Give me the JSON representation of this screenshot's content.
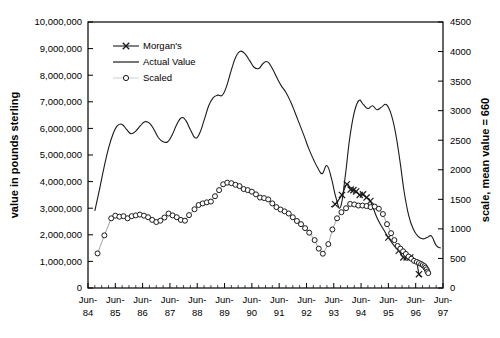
{
  "chart_data": {
    "type": "line",
    "title": "",
    "xlabel": "",
    "ylabel": "value in pounds sterling",
    "y2label": "scale, mean value = 660",
    "xlim": [
      "Jun-84",
      "Jun-97"
    ],
    "ylim": [
      0,
      10000000
    ],
    "y2lim": [
      0,
      4500
    ],
    "grid": false,
    "legend_position": "top-left-inside",
    "y_ticks": [
      "0",
      "1,000,000",
      "2,000,000",
      "3,000,000",
      "4,000,000",
      "5,000,000",
      "6,000,000",
      "7,000,000",
      "8,000,000",
      "9,000,000",
      "10,000,000"
    ],
    "y_tick_values": [
      0,
      1000000,
      2000000,
      3000000,
      4000000,
      5000000,
      6000000,
      7000000,
      8000000,
      9000000,
      10000000
    ],
    "y2_ticks": [
      "0",
      "500",
      "1000",
      "1500",
      "2000",
      "2500",
      "3000",
      "3500",
      "4000",
      "4500"
    ],
    "y2_tick_values": [
      0,
      500,
      1000,
      1500,
      2000,
      2500,
      3000,
      3500,
      4000,
      4500
    ],
    "x_ticks": [
      {
        "line1": "Jun-",
        "line2": "84",
        "value": 1984.5
      },
      {
        "line1": "Jun-",
        "line2": "85",
        "value": 1985.5
      },
      {
        "line1": "Jun-",
        "line2": "86",
        "value": 1986.5
      },
      {
        "line1": "Jun-",
        "line2": "87",
        "value": 1987.5
      },
      {
        "line1": "Jun-",
        "line2": "88",
        "value": 1988.5
      },
      {
        "line1": "Jun-",
        "line2": "89",
        "value": 1989.5
      },
      {
        "line1": "Jun-",
        "line2": "90",
        "value": 1990.5
      },
      {
        "line1": "Jun-",
        "line2": "91",
        "value": 1991.5
      },
      {
        "line1": "Jun-",
        "line2": "92",
        "value": 1992.5
      },
      {
        "line1": "Jun-",
        "line2": "93",
        "value": 1993.5
      },
      {
        "line1": "Jun-",
        "line2": "94",
        "value": 1994.5
      },
      {
        "line1": "Jun-",
        "line2": "95",
        "value": 1995.5
      },
      {
        "line1": "Jun-",
        "line2": "96",
        "value": 1996.5
      },
      {
        "line1": "Jun-",
        "line2": "97",
        "value": 1997.5
      }
    ],
    "legend": [
      {
        "name": "Morgan's",
        "marker": "x",
        "line": true
      },
      {
        "name": "Actual Value",
        "marker": "none",
        "line": true
      },
      {
        "name": "Scaled",
        "marker": "circle",
        "line": true
      }
    ],
    "series": [
      {
        "name": "Actual Value",
        "axis": "left",
        "marker": "none",
        "points": [
          [
            1984.75,
            2900000
          ],
          [
            1984.92,
            3700000
          ],
          [
            1985.08,
            4500000
          ],
          [
            1985.25,
            5250000
          ],
          [
            1985.42,
            5800000
          ],
          [
            1985.58,
            6100000
          ],
          [
            1985.75,
            6150000
          ],
          [
            1985.92,
            5950000
          ],
          [
            1986.08,
            5800000
          ],
          [
            1986.25,
            5900000
          ],
          [
            1986.42,
            6100000
          ],
          [
            1986.58,
            6250000
          ],
          [
            1986.75,
            6200000
          ],
          [
            1986.92,
            5950000
          ],
          [
            1987.08,
            5650000
          ],
          [
            1987.25,
            5500000
          ],
          [
            1987.42,
            5500000
          ],
          [
            1987.58,
            5750000
          ],
          [
            1987.75,
            6150000
          ],
          [
            1987.92,
            6400000
          ],
          [
            1988.08,
            6300000
          ],
          [
            1988.25,
            5950000
          ],
          [
            1988.42,
            5650000
          ],
          [
            1988.58,
            5800000
          ],
          [
            1988.75,
            6300000
          ],
          [
            1988.92,
            6850000
          ],
          [
            1989.08,
            7150000
          ],
          [
            1989.25,
            7250000
          ],
          [
            1989.42,
            7250000
          ],
          [
            1989.58,
            7600000
          ],
          [
            1989.75,
            8200000
          ],
          [
            1989.92,
            8700000
          ],
          [
            1990.08,
            8900000
          ],
          [
            1990.25,
            8800000
          ],
          [
            1990.42,
            8550000
          ],
          [
            1990.58,
            8300000
          ],
          [
            1990.75,
            8250000
          ],
          [
            1990.92,
            8450000
          ],
          [
            1991.08,
            8500000
          ],
          [
            1991.25,
            8250000
          ],
          [
            1991.42,
            7900000
          ],
          [
            1991.58,
            7600000
          ],
          [
            1991.75,
            7350000
          ],
          [
            1991.92,
            7000000
          ],
          [
            1992.08,
            6600000
          ],
          [
            1992.25,
            6150000
          ],
          [
            1992.42,
            5700000
          ],
          [
            1992.58,
            5250000
          ],
          [
            1992.75,
            4850000
          ],
          [
            1992.92,
            4500000
          ],
          [
            1993.08,
            4300000
          ],
          [
            1993.25,
            4600000
          ],
          [
            1993.42,
            4100000
          ],
          [
            1993.58,
            3400000
          ],
          [
            1993.75,
            3050000
          ],
          [
            1993.92,
            4200000
          ],
          [
            1994.08,
            5600000
          ],
          [
            1994.25,
            6600000
          ],
          [
            1994.42,
            7050000
          ],
          [
            1994.58,
            6900000
          ],
          [
            1994.75,
            6750000
          ],
          [
            1994.92,
            6850000
          ],
          [
            1995.08,
            6700000
          ],
          [
            1995.25,
            6800000
          ],
          [
            1995.42,
            6900000
          ],
          [
            1995.58,
            6600000
          ],
          [
            1995.75,
            5900000
          ],
          [
            1995.92,
            4800000
          ],
          [
            1996.08,
            3600000
          ],
          [
            1996.25,
            2700000
          ],
          [
            1996.42,
            2200000
          ],
          [
            1996.58,
            1950000
          ],
          [
            1996.75,
            1850000
          ],
          [
            1996.92,
            1900000
          ],
          [
            1997.08,
            1950000
          ],
          [
            1997.25,
            1600000
          ],
          [
            1997.42,
            1500000
          ]
        ]
      },
      {
        "name": "Morgan's",
        "axis": "left",
        "marker": "x",
        "marker_points": [
          [
            1993.55,
            3150000
          ],
          [
            1993.8,
            3500000
          ],
          [
            1993.98,
            3900000
          ],
          [
            1994.12,
            3700000
          ],
          [
            1994.22,
            3680000
          ],
          [
            1994.32,
            3630000
          ],
          [
            1994.45,
            3500000
          ],
          [
            1994.57,
            3520000
          ],
          [
            1994.7,
            3400000
          ],
          [
            1994.84,
            3270000
          ],
          [
            1995.5,
            1900000
          ],
          [
            1995.88,
            1400000
          ],
          [
            1996.05,
            1150000
          ],
          [
            1996.17,
            1150000
          ],
          [
            1996.3,
            1150000
          ],
          [
            1996.62,
            520000
          ]
        ],
        "points": [
          [
            1993.4,
            3050000
          ],
          [
            1993.55,
            3150000
          ],
          [
            1993.8,
            3500000
          ],
          [
            1993.98,
            3900000
          ],
          [
            1994.12,
            3700000
          ],
          [
            1994.22,
            3680000
          ],
          [
            1994.32,
            3630000
          ],
          [
            1994.45,
            3500000
          ],
          [
            1994.57,
            3520000
          ],
          [
            1994.7,
            3400000
          ],
          [
            1994.84,
            3270000
          ],
          [
            1995.1,
            2600000
          ],
          [
            1995.35,
            2150000
          ],
          [
            1995.5,
            1900000
          ],
          [
            1995.7,
            1600000
          ],
          [
            1995.88,
            1400000
          ],
          [
            1996.05,
            1150000
          ],
          [
            1996.17,
            1150000
          ],
          [
            1996.3,
            1150000
          ],
          [
            1996.45,
            1080000
          ],
          [
            1996.55,
            900000
          ],
          [
            1996.62,
            520000
          ],
          [
            1996.7,
            420000
          ]
        ]
      },
      {
        "name": "Scaled",
        "axis": "left",
        "marker": "circle",
        "points": [
          [
            1984.85,
            1300000
          ],
          [
            1985.1,
            1980000
          ],
          [
            1985.35,
            2620000
          ],
          [
            1985.5,
            2720000
          ],
          [
            1985.65,
            2680000
          ],
          [
            1985.8,
            2700000
          ],
          [
            1985.95,
            2620000
          ],
          [
            1986.1,
            2700000
          ],
          [
            1986.25,
            2730000
          ],
          [
            1986.4,
            2760000
          ],
          [
            1986.55,
            2720000
          ],
          [
            1986.7,
            2660000
          ],
          [
            1986.85,
            2560000
          ],
          [
            1987.0,
            2480000
          ],
          [
            1987.15,
            2530000
          ],
          [
            1987.3,
            2650000
          ],
          [
            1987.45,
            2800000
          ],
          [
            1987.6,
            2730000
          ],
          [
            1987.75,
            2660000
          ],
          [
            1987.9,
            2560000
          ],
          [
            1988.05,
            2530000
          ],
          [
            1988.2,
            2740000
          ],
          [
            1988.4,
            2960000
          ],
          [
            1988.55,
            3120000
          ],
          [
            1988.7,
            3180000
          ],
          [
            1988.85,
            3220000
          ],
          [
            1989.0,
            3250000
          ],
          [
            1989.15,
            3450000
          ],
          [
            1989.3,
            3680000
          ],
          [
            1989.45,
            3900000
          ],
          [
            1989.6,
            3960000
          ],
          [
            1989.75,
            3940000
          ],
          [
            1989.9,
            3880000
          ],
          [
            1990.05,
            3830000
          ],
          [
            1990.2,
            3720000
          ],
          [
            1990.35,
            3680000
          ],
          [
            1990.5,
            3620000
          ],
          [
            1990.65,
            3520000
          ],
          [
            1990.8,
            3400000
          ],
          [
            1990.95,
            3380000
          ],
          [
            1991.1,
            3330000
          ],
          [
            1991.25,
            3180000
          ],
          [
            1991.4,
            3040000
          ],
          [
            1991.55,
            2950000
          ],
          [
            1991.7,
            2880000
          ],
          [
            1991.85,
            2800000
          ],
          [
            1992.0,
            2660000
          ],
          [
            1992.15,
            2520000
          ],
          [
            1992.3,
            2400000
          ],
          [
            1992.45,
            2250000
          ],
          [
            1992.6,
            2080000
          ],
          [
            1992.8,
            1800000
          ],
          [
            1992.95,
            1480000
          ],
          [
            1993.1,
            1290000
          ],
          [
            1993.3,
            1650000
          ],
          [
            1993.45,
            2200000
          ],
          [
            1993.62,
            2620000
          ],
          [
            1993.78,
            2850000
          ],
          [
            1993.95,
            3000000
          ],
          [
            1994.1,
            3160000
          ],
          [
            1994.25,
            3140000
          ],
          [
            1994.4,
            3100000
          ],
          [
            1994.55,
            3100000
          ],
          [
            1994.7,
            3080000
          ],
          [
            1994.85,
            3040000
          ],
          [
            1995.0,
            3060000
          ],
          [
            1995.15,
            2980000
          ],
          [
            1995.3,
            2780000
          ],
          [
            1995.45,
            2400000
          ],
          [
            1995.6,
            2060000
          ],
          [
            1995.72,
            1800000
          ],
          [
            1995.84,
            1580000
          ],
          [
            1995.94,
            1480000
          ],
          [
            1996.04,
            1380000
          ],
          [
            1996.14,
            1280000
          ],
          [
            1996.24,
            1180000
          ],
          [
            1996.34,
            1100000
          ],
          [
            1996.44,
            1020000
          ],
          [
            1996.54,
            980000
          ],
          [
            1996.62,
            940000
          ],
          [
            1996.7,
            900000
          ],
          [
            1996.76,
            860000
          ],
          [
            1996.82,
            820000
          ],
          [
            1996.86,
            760000
          ],
          [
            1996.9,
            700000
          ],
          [
            1996.93,
            620000
          ],
          [
            1996.96,
            560000
          ]
        ]
      }
    ]
  },
  "colors": {
    "line": "#1a1a1a",
    "axis": "#000000",
    "background": "#ffffff"
  }
}
